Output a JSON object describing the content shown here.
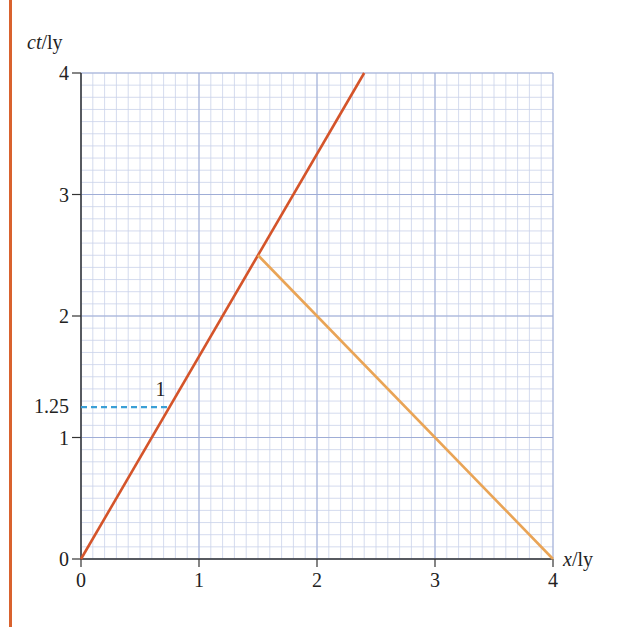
{
  "chart_data": {
    "type": "line",
    "title": "",
    "xlabel": "x/ly",
    "ylabel": "ct/ly",
    "xlabel_parts": {
      "var": "x",
      "unit": "/ly"
    },
    "ylabel_parts": {
      "var": "ct",
      "unit": "/ly"
    },
    "xlim": [
      0,
      4
    ],
    "ylim": [
      0,
      4
    ],
    "x_ticks": [
      0,
      1,
      2,
      3,
      4
    ],
    "y_ticks": [
      0,
      1,
      1.25,
      2,
      3,
      4
    ],
    "x_tick_labels": [
      "0",
      "1",
      "2",
      "3",
      "4"
    ],
    "y_tick_labels": [
      "0",
      "1",
      "1.25",
      "2",
      "3",
      "4"
    ],
    "grid": {
      "major": 1,
      "minor": 0.1,
      "on": true
    },
    "series": [
      {
        "name": "outbound worldline",
        "color": "#d4542a",
        "points": [
          [
            0,
            0
          ],
          [
            2.4,
            4
          ]
        ]
      },
      {
        "name": "return light signal",
        "color": "#e9a456",
        "points": [
          [
            1.5,
            2.5
          ],
          [
            4,
            0
          ]
        ]
      },
      {
        "name": "event 1 projection",
        "color": "#3a9fd6",
        "style": "dashed",
        "points": [
          [
            0,
            1.25
          ],
          [
            0.75,
            1.25
          ]
        ]
      }
    ],
    "annotations": [
      {
        "text": "1",
        "x": 0.7,
        "y": 1.38
      },
      {
        "text": "1.25",
        "axis": "y",
        "value": 1.25
      }
    ]
  }
}
